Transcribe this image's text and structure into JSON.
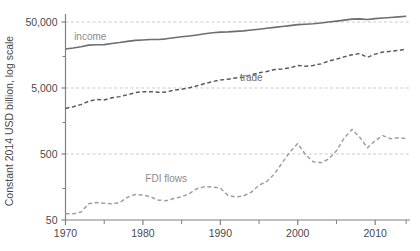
{
  "chart_data": {
    "type": "line",
    "title": "",
    "subtitle": "",
    "xlabel": "",
    "ylabel": "Constant 2014 USD billion, log scale",
    "scale": "log",
    "xlim": [
      1970,
      2014.5
    ],
    "ylim": [
      50,
      100000
    ],
    "grid": true,
    "gridlines": [
      500,
      5000,
      50000
    ],
    "legend_position": "inline-annotations",
    "ytick_labels": [
      "50,000",
      "5,000",
      "500",
      "50"
    ],
    "ytick_values": [
      50000,
      5000,
      500,
      50
    ],
    "yminor_ticks": [
      150,
      1500,
      15000
    ],
    "xtick_labels": [
      "1970",
      "1980",
      "1990",
      "2000",
      "2010"
    ],
    "xtick_values": [
      1970,
      1980,
      1990,
      2000,
      2010
    ],
    "xminor_ticks": [
      1975,
      1985,
      1995,
      2005,
      2014
    ],
    "colors": {
      "income": "#6e6e6e",
      "trade": "#5a5a5a",
      "fdi": "#a0a0a0",
      "grid": "#c9c9c9",
      "axis": "#808080",
      "text": "#4a4a4a"
    },
    "series": [
      {
        "name": "income",
        "label": "income",
        "style": "solid",
        "color": "#6e6e6e",
        "label_x": 1973.2,
        "label_y": 27000,
        "x": [
          1970,
          1971,
          1972,
          1973,
          1974,
          1975,
          1976,
          1977,
          1978,
          1979,
          1980,
          1981,
          1982,
          1983,
          1984,
          1985,
          1986,
          1987,
          1988,
          1989,
          1990,
          1991,
          1992,
          1993,
          1994,
          1995,
          1996,
          1997,
          1998,
          1999,
          2000,
          2001,
          2002,
          2003,
          2004,
          2005,
          2006,
          2007,
          2008,
          2009,
          2010,
          2011,
          2012,
          2013,
          2014
        ],
        "values": [
          19500,
          20200,
          21100,
          22300,
          22600,
          22700,
          23600,
          24400,
          25400,
          26300,
          26700,
          27100,
          27200,
          27800,
          28900,
          29800,
          30700,
          31800,
          33100,
          34300,
          35100,
          35400,
          36000,
          36700,
          37800,
          38900,
          40100,
          41500,
          42700,
          44000,
          45600,
          46200,
          47000,
          48200,
          50000,
          51600,
          53400,
          55200,
          55800,
          54600,
          56200,
          57600,
          58600,
          59800,
          61200
        ]
      },
      {
        "name": "trade",
        "label": "trade",
        "style": "dashed",
        "color": "#5a5a5a",
        "label_x": 1994.0,
        "label_y": 6400,
        "x": [
          1970,
          1971,
          1972,
          1973,
          1974,
          1975,
          1976,
          1977,
          1978,
          1979,
          1980,
          1981,
          1982,
          1983,
          1984,
          1985,
          1986,
          1987,
          1988,
          1989,
          1990,
          1991,
          1992,
          1993,
          1994,
          1995,
          1996,
          1997,
          1998,
          1999,
          2000,
          2001,
          2002,
          2003,
          2004,
          2005,
          2006,
          2007,
          2008,
          2009,
          2010,
          2011,
          2012,
          2013,
          2014
        ],
        "values": [
          2450,
          2600,
          2800,
          3150,
          3350,
          3300,
          3550,
          3700,
          3950,
          4250,
          4400,
          4400,
          4300,
          4350,
          4650,
          4800,
          5050,
          5400,
          5850,
          6250,
          6600,
          6800,
          7100,
          7300,
          7900,
          8500,
          8900,
          9500,
          9700,
          10100,
          11000,
          10700,
          11000,
          11600,
          12800,
          13700,
          14800,
          15900,
          16600,
          14600,
          16300,
          17500,
          18000,
          18600,
          19300
        ]
      },
      {
        "name": "FDI flows",
        "label": "FDI flows",
        "style": "dashed",
        "color": "#a0a0a0",
        "label_x": 1983.0,
        "label_y": 185,
        "x": [
          1970,
          1971,
          1972,
          1973,
          1974,
          1975,
          1976,
          1977,
          1978,
          1979,
          1980,
          1981,
          1982,
          1983,
          1984,
          1985,
          1986,
          1987,
          1988,
          1989,
          1990,
          1991,
          1992,
          1993,
          1994,
          1995,
          1996,
          1997,
          1998,
          1999,
          2000,
          2001,
          2002,
          2003,
          2004,
          2005,
          2006,
          2007,
          2008,
          2009,
          2010,
          2011,
          2012,
          2013,
          2014
        ],
        "values": [
          62,
          62,
          66,
          88,
          92,
          90,
          88,
          92,
          110,
          122,
          120,
          112,
          100,
          98,
          106,
          112,
          126,
          150,
          160,
          158,
          152,
          118,
          112,
          116,
          132,
          168,
          192,
          250,
          370,
          540,
          720,
          490,
          380,
          370,
          420,
          560,
          870,
          1180,
          900,
          620,
          800,
          950,
          850,
          880,
          860
        ]
      }
    ],
    "annotations": [
      {
        "text": "income",
        "series": "income"
      },
      {
        "text": "trade",
        "series": "trade"
      },
      {
        "text": "FDI flows",
        "series": "FDI flows"
      }
    ]
  }
}
